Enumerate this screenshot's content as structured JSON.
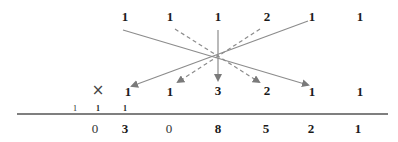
{
  "multiplicand": {
    "digits": [
      "1",
      "1",
      "1",
      "2",
      "1",
      "1"
    ]
  },
  "multiplier": {
    "operator_symbol": "×",
    "digits": [
      "1",
      "1",
      "3",
      "2",
      "1",
      "1"
    ]
  },
  "carries": [
    "1",
    "1",
    "1"
  ],
  "result": {
    "digits": [
      "0",
      "3",
      "0",
      "8",
      "5",
      "2",
      "1"
    ]
  },
  "colors": {
    "line": "#8c8c8c",
    "arrow": "#7a7a7a",
    "text": "#1a1a1a",
    "rule": "#555555"
  }
}
